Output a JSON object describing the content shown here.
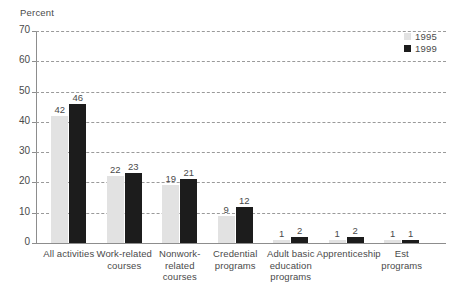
{
  "chart_data": {
    "type": "bar",
    "title": "",
    "xlabel": "",
    "ylabel": "Percent",
    "ylim": [
      0,
      70
    ],
    "yticks": [
      0,
      10,
      20,
      30,
      40,
      50,
      60,
      70
    ],
    "grid": true,
    "legend_position": "top-right",
    "categories": [
      "All activities",
      "Work-related courses",
      "Nonwork-related courses",
      "Credential programs",
      "Adult basic education programs",
      "Apprenticeship",
      "Est programs"
    ],
    "category_lines": [
      [
        "All activities"
      ],
      [
        "Work-related",
        "courses"
      ],
      [
        "Nonwork-",
        "related",
        "courses"
      ],
      [
        "Credential",
        "programs"
      ],
      [
        "Adult basic",
        "education",
        "programs"
      ],
      [
        "Apprenticeship"
      ],
      [
        "Est",
        "programs"
      ]
    ],
    "series": [
      {
        "name": "1995",
        "color": "#e2e2e2",
        "values": [
          42,
          22,
          19,
          9,
          1,
          1,
          1
        ]
      },
      {
        "name": "1999",
        "color": "#1c1c1c",
        "values": [
          46,
          23,
          21,
          12,
          2,
          2,
          1
        ]
      }
    ]
  },
  "axis": {
    "y_title": "Percent"
  },
  "legend": {
    "items": [
      {
        "label": "1995",
        "color": "#e2e2e2"
      },
      {
        "label": "1999",
        "color": "#1c1c1c"
      }
    ]
  },
  "caption": {
    "partial_text": ""
  }
}
